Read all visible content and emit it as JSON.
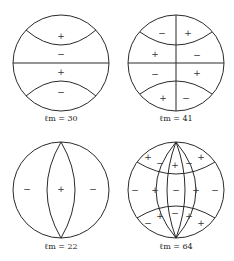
{
  "panels": [
    {
      "id": "lm30",
      "label": "ℓm = 30",
      "signs": [
        "+",
        "−",
        "+",
        "−"
      ]
    },
    {
      "id": "lm41",
      "label": "ℓm = 41",
      "signs": [
        "−",
        "+",
        "+",
        "−",
        "−",
        "+",
        "+",
        "−"
      ]
    },
    {
      "id": "lm22",
      "label": "ℓm = 22",
      "signs": [
        "−",
        "+",
        "−"
      ]
    },
    {
      "id": "lm64",
      "label": "ℓm = 64",
      "signs": [
        "+",
        "−",
        "+",
        "−",
        "+",
        "−",
        "+",
        "−",
        "+",
        "−",
        "+",
        "−",
        "+",
        "−",
        "+"
      ]
    }
  ],
  "colors": {
    "line": "#2a2a2a",
    "text": "#222222",
    "background": "#ffffff"
  }
}
